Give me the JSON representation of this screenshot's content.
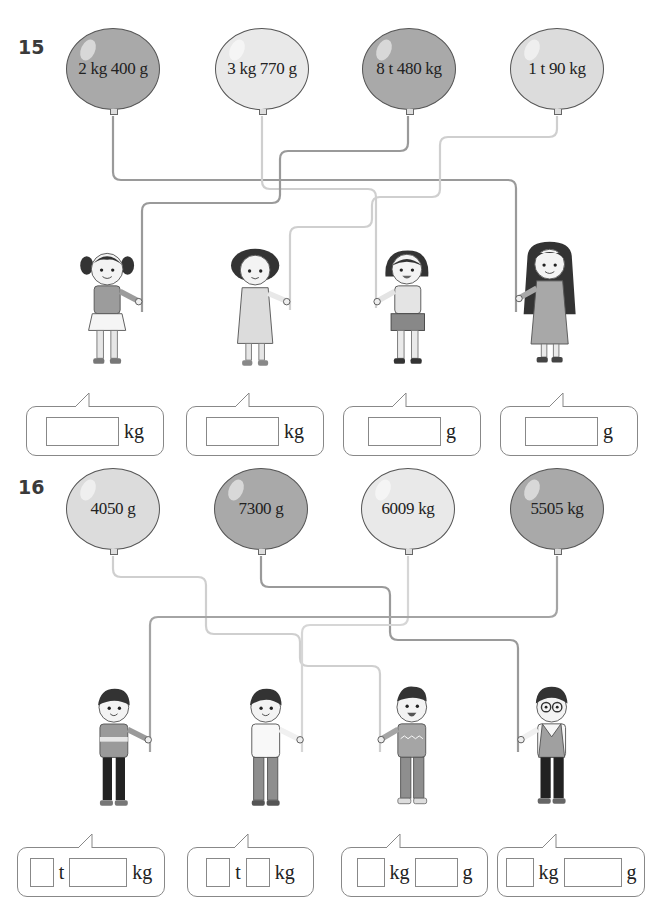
{
  "problems": [
    {
      "number": "15",
      "balloons": [
        {
          "label": "2 kg  400 g",
          "shade": "dark"
        },
        {
          "label": "3 kg  770 g",
          "shade": "lighter"
        },
        {
          "label": "8 t  480 kg",
          "shade": "dark"
        },
        {
          "label": "1 t  90 kg",
          "shade": "light"
        }
      ],
      "children": [
        {
          "description": "girl with pigtails"
        },
        {
          "description": "girl with curly hair"
        },
        {
          "description": "girl with bob haircut"
        },
        {
          "description": "girl with long hair"
        }
      ],
      "answers": [
        {
          "units": [
            "kg"
          ]
        },
        {
          "units": [
            "kg"
          ]
        },
        {
          "units": [
            "g"
          ]
        },
        {
          "units": [
            "g"
          ]
        }
      ]
    },
    {
      "number": "16",
      "balloons": [
        {
          "label": "4050 g",
          "shade": "light"
        },
        {
          "label": "7300 g",
          "shade": "dark"
        },
        {
          "label": "6009 kg",
          "shade": "lighter"
        },
        {
          "label": "5505 kg",
          "shade": "dark"
        }
      ],
      "children": [
        {
          "description": "boy in hoodie"
        },
        {
          "description": "boy in white shirt"
        },
        {
          "description": "boy in sweater"
        },
        {
          "description": "boy with glasses"
        }
      ],
      "answers": [
        {
          "units": [
            "t",
            "kg"
          ]
        },
        {
          "units": [
            "t",
            "kg"
          ]
        },
        {
          "units": [
            "kg",
            "g"
          ]
        },
        {
          "units": [
            "kg",
            "g"
          ]
        }
      ]
    }
  ],
  "colors": {
    "dark_balloon": "#a9a9a9",
    "light_balloon": "#dcdcdc",
    "lighter_balloon": "#e9e9e9",
    "string_dark": "#9a9a9a",
    "string_light": "#cfcfcf"
  }
}
